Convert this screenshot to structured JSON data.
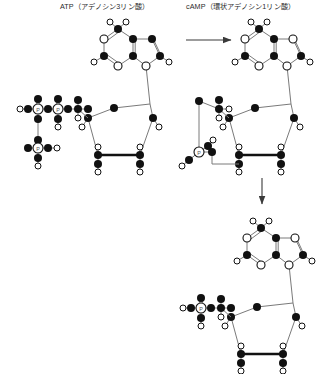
{
  "diagram": {
    "title_atp": "ATP（アデノシン3リン酸）",
    "title_camp": "cAMP（環状アデノシン1リン酸）",
    "colors": {
      "carbon_fill": "#111111",
      "heteroatom_fill": "#ffffff",
      "bond_stroke": "#6f6f6f",
      "outline": "#111111",
      "arrow": "#3a3a3a",
      "text": "#2b2b2b",
      "background": "#ffffff"
    },
    "atom_legend": {
      "filled_circle": "carbon",
      "open_circle": "oxygen-or-nitrogen",
      "labeled_circle": "phosphorus"
    },
    "phosphorus_label": "P",
    "structures": [
      {
        "name": "ATP",
        "label": "ATP（アデノシン3リン酸）",
        "phosphate_count": 3,
        "position": "top-left"
      },
      {
        "name": "cAMP",
        "label": "cAMP（環状アデノシン1リン酸）",
        "phosphate_count": 1,
        "cyclic_phosphate": true,
        "position": "top-right"
      },
      {
        "name": "AMP",
        "label": "",
        "phosphate_count": 1,
        "position": "bottom-right"
      }
    ],
    "arrows": [
      {
        "name": "atp-to-camp",
        "direction": "right"
      },
      {
        "name": "camp-to-amp",
        "direction": "down"
      }
    ]
  }
}
